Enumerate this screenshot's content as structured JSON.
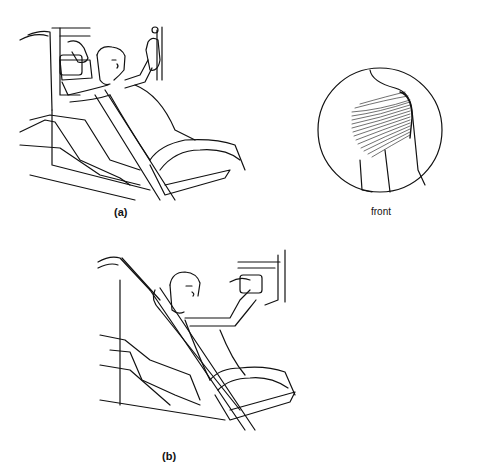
{
  "figure": {
    "panels": [
      {
        "id": "a",
        "label": "(a)",
        "description": "person seated reclined on machine, arms raised gripping handles overhead"
      },
      {
        "id": "b",
        "label": "(b)",
        "description": "person seated on inclined machine, arms pushing handles forward at chest level"
      }
    ],
    "inset": {
      "label": "front",
      "description": "circular detail of shoulder muscle fibers, front view"
    },
    "colors": {
      "line": "#111111",
      "background": "#ffffff"
    }
  }
}
